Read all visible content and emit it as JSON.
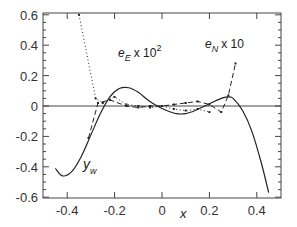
{
  "chart_data": {
    "type": "line",
    "title": "",
    "xlabel": "x",
    "ylabel": "",
    "xlim": [
      -0.5,
      0.5
    ],
    "ylim": [
      -0.6,
      0.6
    ],
    "grid": false,
    "legend_position": "inline annotations",
    "xticks": [
      "-0.4",
      "-0.2",
      "0",
      "0.2",
      "0.4"
    ],
    "yticks": [
      "0.6",
      "0.4",
      "0.2",
      "0",
      "-0.2",
      "-0.4",
      "-0.6"
    ],
    "zero_line": true,
    "series": [
      {
        "name": "y_w",
        "label_main": "y",
        "label_sub": "w",
        "style": "solid",
        "x": [
          -0.45,
          -0.42,
          -0.38,
          -0.34,
          -0.3,
          -0.26,
          -0.22,
          -0.18,
          -0.14,
          -0.1,
          -0.06,
          -0.02,
          0.02,
          0.06,
          0.1,
          0.14,
          0.18,
          0.22,
          0.26,
          0.28,
          0.3,
          0.34,
          0.38,
          0.42,
          0.45
        ],
        "y": [
          -0.41,
          -0.46,
          -0.43,
          -0.33,
          -0.19,
          -0.05,
          0.06,
          0.115,
          0.12,
          0.09,
          0.04,
          0.0,
          -0.03,
          -0.05,
          -0.05,
          -0.03,
          0.0,
          0.03,
          0.055,
          0.06,
          0.05,
          -0.03,
          -0.17,
          -0.38,
          -0.57
        ]
      },
      {
        "name": "e_E x 10^2",
        "label_main": "e",
        "label_sub": "E",
        "label_suffix": " x 10",
        "label_sup": "2",
        "style": "dotted",
        "x": [
          -0.35,
          -0.28,
          -0.25,
          -0.2,
          -0.15,
          -0.1,
          -0.05,
          0.0,
          0.05,
          0.1,
          0.15,
          0.2
        ],
        "y": [
          0.6,
          0.05,
          0.02,
          0.06,
          0.01,
          0.0,
          -0.01,
          0.0,
          -0.02,
          -0.03,
          -0.02,
          -0.04
        ]
      },
      {
        "name": "e_N x 10",
        "label_main": "e",
        "label_sub": "N",
        "label_suffix": " x 10",
        "style": "dashed",
        "x": [
          -0.31,
          -0.27,
          -0.22,
          -0.15,
          -0.1,
          -0.05,
          0.0,
          0.05,
          0.1,
          0.15,
          0.2,
          0.25,
          0.28,
          0.31
        ],
        "y": [
          -0.21,
          0.02,
          0.04,
          0.0,
          -0.01,
          0.0,
          0.0,
          0.01,
          0.02,
          0.03,
          0.01,
          -0.04,
          0.07,
          0.28
        ]
      }
    ],
    "annotations": [
      {
        "text": "e_E x 10^2",
        "x": -0.27,
        "y": 0.37
      },
      {
        "text": "e_N x 10",
        "x": 0.18,
        "y": 0.41
      },
      {
        "text": "y_w",
        "x": -0.36,
        "y": -0.37
      }
    ]
  },
  "labels": {
    "x_axis": "x",
    "eE_main": "e",
    "eE_sub": "E",
    "eE_suffix": "x 10",
    "eE_sup": "2",
    "eN_main": "e",
    "eN_sub": "N",
    "eN_suffix": "x 10",
    "yw_main": "y",
    "yw_sub": "w"
  }
}
